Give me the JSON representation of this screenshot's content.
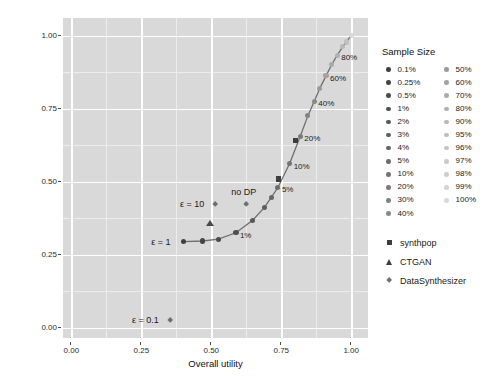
{
  "chart_data": {
    "type": "scatter",
    "title": "",
    "xlabel": "Overall utility",
    "ylabel": "Risk (marginal TCAP)",
    "xlim": [
      -0.03,
      1.06
    ],
    "ylim": [
      -0.035,
      1.06
    ],
    "xticks": [
      "0.00",
      "0.25",
      "0.50",
      "0.75",
      "1.00"
    ],
    "xtickvalues": [
      0.0,
      0.25,
      0.5,
      0.75,
      1.0
    ],
    "yticks": [
      "0.00",
      "0.25",
      "0.50",
      "0.75",
      "1.00"
    ],
    "ytickvalues": [
      0.0,
      0.25,
      0.5,
      0.75,
      1.0
    ],
    "grid": true,
    "legend_position": "right",
    "panel_background": "#d9d9d9",
    "gridline_color": "#ffffff",
    "series": [
      {
        "name": "synthpop",
        "shape": "square",
        "color": "#3d3d3d",
        "points": [
          {
            "sample_size": "5%",
            "x": 0.74,
            "y": 0.509
          },
          {
            "sample_size": "20%",
            "x": 0.8,
            "y": 0.64
          }
        ]
      },
      {
        "name": "CTGAN",
        "shape": "triangle",
        "color": "#4a4a4a",
        "points": [
          {
            "label": "",
            "x": 0.497,
            "y": 0.356
          }
        ]
      },
      {
        "name": "DataSynthesizer",
        "shape": "diamond",
        "color": "#6e6e6e",
        "points": [
          {
            "label": "ε = 0.1",
            "x": 0.352,
            "y": 0.027
          },
          {
            "label": "ε = 10",
            "x": 0.513,
            "y": 0.422
          },
          {
            "label": "no DP",
            "x": 0.625,
            "y": 0.422
          }
        ]
      },
      {
        "name": "sample-size curve",
        "shape": "circle",
        "color": "#474747",
        "points": [
          {
            "sample_size": "0.1%",
            "x": 0.4,
            "y": 0.295,
            "label": "ε = 1"
          },
          {
            "sample_size": "0.25%",
            "x": 0.47,
            "y": 0.297,
            "label": ""
          },
          {
            "sample_size": "0.5%",
            "x": 0.525,
            "y": 0.303,
            "label": ""
          },
          {
            "sample_size": "1%",
            "x": 0.588,
            "y": 0.325,
            "label": "1%"
          },
          {
            "sample_size": "2%",
            "x": 0.648,
            "y": 0.368,
            "label": ""
          },
          {
            "sample_size": "3%",
            "x": 0.69,
            "y": 0.412,
            "label": ""
          },
          {
            "sample_size": "4%",
            "x": 0.715,
            "y": 0.447,
            "label": ""
          },
          {
            "sample_size": "5%",
            "x": 0.738,
            "y": 0.48,
            "label": "5%"
          },
          {
            "sample_size": "10%",
            "x": 0.78,
            "y": 0.562,
            "label": "10%"
          },
          {
            "sample_size": "20%",
            "x": 0.818,
            "y": 0.655,
            "label": "20%"
          },
          {
            "sample_size": "30%",
            "x": 0.845,
            "y": 0.725,
            "label": ""
          },
          {
            "sample_size": "40%",
            "x": 0.868,
            "y": 0.775,
            "label": "40%"
          },
          {
            "sample_size": "50%",
            "x": 0.888,
            "y": 0.82,
            "label": ""
          },
          {
            "sample_size": "60%",
            "x": 0.91,
            "y": 0.862,
            "label": "60%"
          },
          {
            "sample_size": "70%",
            "x": 0.93,
            "y": 0.9,
            "label": ""
          },
          {
            "sample_size": "80%",
            "x": 0.95,
            "y": 0.933,
            "label": "80%"
          },
          {
            "sample_size": "90%",
            "x": 0.97,
            "y": 0.962,
            "label": ""
          },
          {
            "sample_size": "95%",
            "x": 0.982,
            "y": 0.978,
            "label": ""
          },
          {
            "sample_size": "100%",
            "x": 1.0,
            "y": 1.0,
            "label": ""
          }
        ]
      }
    ],
    "annotations": [
      {
        "text": "ε = 1",
        "x": 0.4,
        "y": 0.295
      },
      {
        "text": "ε = 10",
        "x": 0.513,
        "y": 0.422
      },
      {
        "text": "ε = 0.1",
        "x": 0.352,
        "y": 0.027
      },
      {
        "text": "no DP",
        "x": 0.625,
        "y": 0.422
      }
    ]
  },
  "legend": {
    "title": "Sample Size",
    "column_one": [
      {
        "label": "0.1%",
        "color": "#3f3f3f"
      },
      {
        "label": "0.25%",
        "color": "#454545"
      },
      {
        "label": "0.5%",
        "color": "#4b4b4b"
      },
      {
        "label": "1%",
        "color": "#515151"
      },
      {
        "label": "2%",
        "color": "#585858"
      },
      {
        "label": "3%",
        "color": "#5f5f5f"
      },
      {
        "label": "4%",
        "color": "#666666"
      },
      {
        "label": "5%",
        "color": "#6d6d6d"
      },
      {
        "label": "10%",
        "color": "#747474"
      },
      {
        "label": "20%",
        "color": "#7b7b7b"
      },
      {
        "label": "30%",
        "color": "#828282"
      },
      {
        "label": "40%",
        "color": "#898989"
      }
    ],
    "column_two": [
      {
        "label": "50%",
        "color": "#9a9a9a"
      },
      {
        "label": "60%",
        "color": "#a2a2a2"
      },
      {
        "label": "70%",
        "color": "#aaaaaa"
      },
      {
        "label": "80%",
        "color": "#b1b1b1"
      },
      {
        "label": "90%",
        "color": "#b8b8b8"
      },
      {
        "label": "95%",
        "color": "#bfbfbf"
      },
      {
        "label": "96%",
        "color": "#c4c4c4"
      },
      {
        "label": "97%",
        "color": "#c9c9c9"
      },
      {
        "label": "98%",
        "color": "#cecece"
      },
      {
        "label": "99%",
        "color": "#d3d3d3"
      },
      {
        "label": "100%",
        "color": "#d8d8d8"
      }
    ],
    "shapes": [
      {
        "label": "synthpop",
        "shape": "square"
      },
      {
        "label": "CTGAN",
        "shape": "triangle"
      },
      {
        "label": "DataSynthesizer",
        "shape": "diamond"
      }
    ]
  }
}
